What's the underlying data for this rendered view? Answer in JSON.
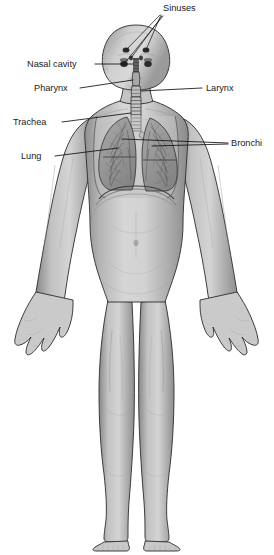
{
  "figure": {
    "background_color": "#ffffff",
    "width": 274,
    "height": 555
  },
  "palette": {
    "skin_light": "#d8d8d8",
    "skin_mid": "#b9b9b9",
    "skin_shadow": "#8f8f8f",
    "skin_deep_shadow": "#6f6f6f",
    "outline": "#2b2b2b",
    "lung_fill": "#9a9a9a",
    "lung_texture": "#4a4a4a",
    "trachea_fill": "#c4c4c4",
    "sinus_dark": "#2a2a2a",
    "label_text": "#1a1a1a",
    "leader_line": "#111111"
  },
  "labels": [
    {
      "id": "sinuses",
      "text": "Sinuses",
      "text_x": 163,
      "text_y": 11,
      "anchor": "start",
      "side": "top",
      "leader_count": 4
    },
    {
      "id": "nasal-cavity",
      "text": "Nasal cavity",
      "text_x": 27,
      "text_y": 67,
      "anchor": "start",
      "side": "left",
      "leader_count": 1
    },
    {
      "id": "pharynx",
      "text": "Pharynx",
      "text_x": 34,
      "text_y": 91,
      "anchor": "start",
      "side": "left",
      "leader_count": 1
    },
    {
      "id": "larynx",
      "text": "Larynx",
      "text_x": 206,
      "text_y": 91,
      "anchor": "start",
      "side": "right",
      "leader_count": 1
    },
    {
      "id": "trachea",
      "text": "Trachea",
      "text_x": 13,
      "text_y": 125,
      "anchor": "start",
      "side": "left",
      "leader_count": 1
    },
    {
      "id": "bronchi",
      "text": "Bronchi",
      "text_x": 231,
      "text_y": 146,
      "anchor": "start",
      "side": "right",
      "leader_count": 2
    },
    {
      "id": "lung",
      "text": "Lung",
      "text_x": 21,
      "text_y": 159,
      "anchor": "start",
      "side": "left",
      "leader_count": 1
    }
  ],
  "anatomy_parts": [
    {
      "id": "head",
      "name": "head"
    },
    {
      "id": "neck",
      "name": "neck"
    },
    {
      "id": "torso",
      "name": "torso"
    },
    {
      "id": "left-arm",
      "name": "left arm"
    },
    {
      "id": "right-arm",
      "name": "right arm"
    },
    {
      "id": "left-leg",
      "name": "left leg"
    },
    {
      "id": "right-leg",
      "name": "right leg"
    },
    {
      "id": "left-lung",
      "name": "left lung"
    },
    {
      "id": "right-lung",
      "name": "right lung"
    },
    {
      "id": "trachea",
      "name": "trachea"
    },
    {
      "id": "bronchi",
      "name": "bronchi"
    },
    {
      "id": "larynx",
      "name": "larynx"
    },
    {
      "id": "pharynx",
      "name": "pharynx"
    },
    {
      "id": "nasal-cavity",
      "name": "nasal cavity"
    },
    {
      "id": "sinuses",
      "name": "sinuses"
    },
    {
      "id": "diaphragm",
      "name": "diaphragm"
    }
  ]
}
